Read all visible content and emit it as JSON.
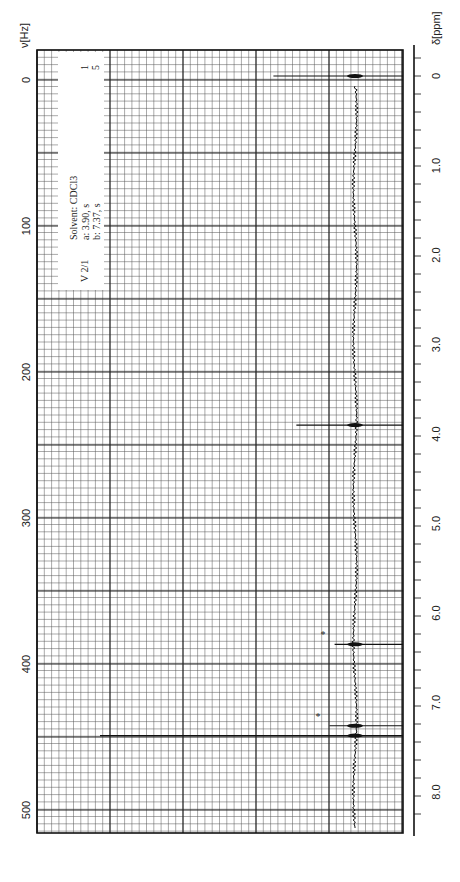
{
  "chart_data": {
    "type": "line",
    "title": "",
    "sample_id": "V 2/1",
    "solvent": "Solvent: CDCl3",
    "integration": [
      "1",
      "5"
    ],
    "assignments": [
      {
        "label": "a:",
        "shift": "3.90,",
        "mult": "s"
      },
      {
        "label": "b:",
        "shift": "7.37,",
        "mult": "s"
      }
    ],
    "hz_axis": {
      "label": "ν[Hz]",
      "ticks": [
        "0",
        "100",
        "200",
        "300",
        "400",
        "500"
      ]
    },
    "ppm_axis": {
      "label": "δ[ppm]",
      "ticks": [
        "0",
        "1.0",
        "2.0",
        "3.0",
        "4.0",
        "5.0",
        "6.0",
        "7.0",
        "8.0"
      ]
    },
    "peaks": [
      {
        "ppm": 0.0,
        "intensity": 0.32,
        "note": "TMS"
      },
      {
        "ppm": 3.9,
        "intensity": 0.23,
        "label": "a"
      },
      {
        "ppm": 6.35,
        "intensity": 0.08,
        "note": "*"
      },
      {
        "ppm": 7.26,
        "intensity": 0.1,
        "note": "*"
      },
      {
        "ppm": 7.37,
        "intensity": 1.0,
        "label": "b"
      }
    ],
    "xlim_ppm": [
      -0.2,
      8.5
    ],
    "grid": true
  }
}
